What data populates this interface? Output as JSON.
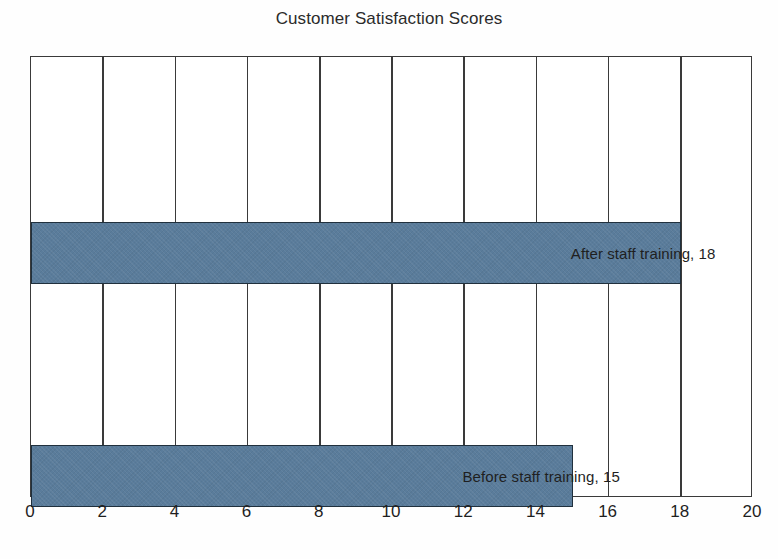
{
  "chart_data": {
    "type": "bar",
    "orientation": "horizontal",
    "title": "Customer Satisfaction Scores",
    "xlabel": "",
    "ylabel": "",
    "xlim": [
      0,
      20
    ],
    "xticks": [
      0,
      2,
      4,
      6,
      8,
      10,
      12,
      14,
      16,
      18,
      20
    ],
    "xtick_labels": [
      "0",
      "2",
      "4",
      "6",
      "8",
      "10",
      "12",
      "14",
      "16",
      "18",
      "20"
    ],
    "grid": "vertical",
    "legend": "none",
    "categories": [
      "Before staff training",
      "After staff training"
    ],
    "values": [
      15,
      18
    ],
    "bars": [
      {
        "category": "After staff training",
        "value": 18,
        "label": "After staff training, 18",
        "order_from_top": 1
      },
      {
        "category": "Before staff training",
        "value": 15,
        "label": "Before staff training, 15",
        "order_from_top": 2
      }
    ],
    "colors": {
      "bar_fill": "#5a7c9b",
      "bar_border": "#20303d",
      "gridline": "#3a3a3a",
      "axis": "#3a3a3a",
      "text": "#1f1f1f",
      "title": "#2b2b2b",
      "background": "#fefefe",
      "plot_background": "#ffffff"
    }
  }
}
